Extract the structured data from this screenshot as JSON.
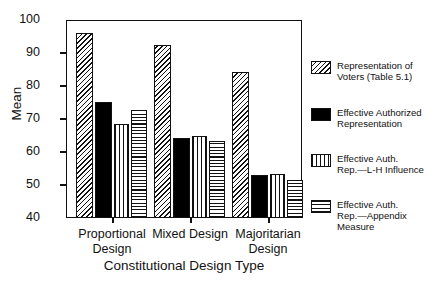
{
  "chart_data": {
    "type": "bar",
    "title": "",
    "xlabel": "Constitutional Design Type",
    "ylabel": "Mean",
    "ylim": [
      40,
      100
    ],
    "yticks": [
      40,
      50,
      60,
      70,
      80,
      90,
      100
    ],
    "grid": false,
    "legend_position": "right",
    "categories": [
      "Proportional Design",
      "Mixed Design",
      "Majoritarian Design"
    ],
    "series": [
      {
        "name": "Representation of Voters (Table 5.1)",
        "fill": "diagonal-hatch",
        "values": [
          96.0,
          92.5,
          84.3
        ]
      },
      {
        "name": "Effective Authorized Representation",
        "fill": "solid-black",
        "values": [
          75.3,
          64.2,
          53.0
        ]
      },
      {
        "name": "Effective Auth. Rep.—L-H Influence",
        "fill": "vertical-hatch",
        "values": [
          68.5,
          65.0,
          53.3
        ]
      },
      {
        "name": "Effective Auth. Rep.—Appendix Measure",
        "fill": "horizontal-hatch",
        "values": [
          72.8,
          63.5,
          51.5
        ]
      }
    ]
  },
  "axis": {
    "y_title": "Mean",
    "y_tick_labels": [
      "100",
      "90",
      "80",
      "70",
      "60",
      "50",
      "40"
    ],
    "x_title": "Constitutional Design Type",
    "x_group_labels": [
      "Proportional\nDesign",
      "Mixed\nDesign",
      "Majoritarian\nDesign"
    ]
  },
  "legend": {
    "items": [
      {
        "label": "Representation of\nVoters (Table 5.1)",
        "swatch": "diagonal-hatch-swatch"
      },
      {
        "label": "Effective Authorized\nRepresentation",
        "swatch": "solid-black-swatch"
      },
      {
        "label": "Effective Auth.\nRep.—L-H Influence",
        "swatch": "vertical-hatch-swatch"
      },
      {
        "label": "Effective Auth.\nRep.—Appendix\nMeasure",
        "swatch": "horizontal-hatch-swatch"
      }
    ]
  },
  "colors": {
    "axis": "#111111",
    "background": "#ffffff",
    "bar_solid": "#000000"
  }
}
